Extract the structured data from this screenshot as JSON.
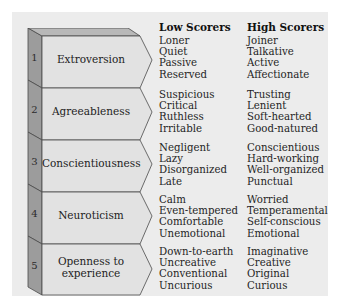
{
  "headers": {
    "low": "Low Scorers",
    "high": "High Scorers"
  },
  "factors": [
    {
      "number": "1",
      "name_line1": "Extroversion",
      "name_line2": "",
      "low": [
        "Loner",
        "Quiet",
        "Passive",
        "Reserved"
      ],
      "high": [
        "Joiner",
        "Talkative",
        "Active",
        "Affectionate"
      ]
    },
    {
      "number": "2",
      "name_line1": "Agreeableness",
      "name_line2": "",
      "low": [
        "Suspicious",
        "Critical",
        "Ruthless",
        "Irritable"
      ],
      "high": [
        "Trusting",
        "Lenient",
        "Soft-hearted",
        "Good-natured"
      ]
    },
    {
      "number": "3",
      "name_line1": "Conscientiousness",
      "name_line2": "",
      "low": [
        "Negligent",
        "Lazy",
        "Disorganized",
        "Late"
      ],
      "high": [
        "Conscientious",
        "Hard-working",
        "Well-organized",
        "Punctual"
      ]
    },
    {
      "number": "4",
      "name_line1": "Neuroticism",
      "name_line2": "",
      "low": [
        "Calm",
        "Even-tempered",
        "Comfortable",
        "Unemotional"
      ],
      "high": [
        "Worried",
        "Temperamental",
        "Self-conscious",
        "Emotional"
      ]
    },
    {
      "number": "5",
      "name_line1": "Openness to",
      "name_line2": "experience",
      "low": [
        "Down-to-earth",
        "Uncreative",
        "Conventional",
        "Uncurious"
      ],
      "high": [
        "Imaginative",
        "Creative",
        "Original",
        "Curious"
      ]
    }
  ],
  "colors": {
    "panel": "#ececec",
    "side": "#9c9c9c",
    "face": "#e2e2e2",
    "top": "#b8b8b8",
    "outline": "#4a4a4a"
  }
}
